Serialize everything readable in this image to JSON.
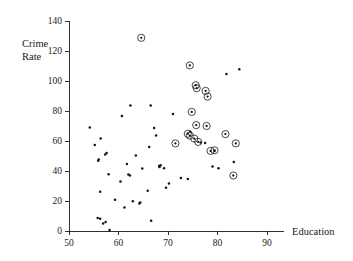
{
  "chart_data": {
    "type": "scatter",
    "title": "",
    "xlabel": "Education",
    "ylabel": "Crime Rate",
    "xlim": [
      50,
      90
    ],
    "ylim": [
      0,
      140
    ],
    "xticks": [
      50,
      60,
      70,
      80,
      90
    ],
    "yticks": [
      0,
      20,
      40,
      60,
      80,
      100,
      120,
      140
    ],
    "grid": false,
    "legend": null,
    "marker_note": "plain dot = ordinary observation; dot enclosed in open circle = highlighted/flagged observation",
    "series": [
      {
        "name": "observations",
        "marker": "dot",
        "points": [
          [
            54.2,
            69.0
          ],
          [
            55.2,
            57.4
          ],
          [
            55.9,
            46.8
          ],
          [
            56.0,
            47.6
          ],
          [
            56.4,
            61.6
          ],
          [
            56.3,
            26.2
          ],
          [
            55.8,
            8.6
          ],
          [
            56.3,
            8.2
          ],
          [
            56.9,
            5.0
          ],
          [
            57.4,
            6.0
          ],
          [
            57.3,
            51.0
          ],
          [
            57.6,
            52.0
          ],
          [
            58.0,
            37.8
          ],
          [
            58.2,
            0.6
          ],
          [
            59.3,
            20.8
          ],
          [
            60.4,
            33.0
          ],
          [
            60.7,
            76.6
          ],
          [
            61.2,
            15.6
          ],
          [
            61.7,
            44.6
          ],
          [
            62.0,
            37.6
          ],
          [
            62.3,
            37.0
          ],
          [
            62.4,
            83.6
          ],
          [
            62.9,
            19.8
          ],
          [
            63.5,
            50.4
          ],
          [
            64.2,
            18.4
          ],
          [
            64.4,
            19.0
          ],
          [
            64.8,
            41.6
          ],
          [
            65.9,
            26.8
          ],
          [
            66.2,
            56.0
          ],
          [
            66.5,
            83.6
          ],
          [
            66.6,
            6.8
          ],
          [
            67.2,
            68.6
          ],
          [
            67.6,
            63.6
          ],
          [
            68.2,
            43.4
          ],
          [
            68.3,
            42.6
          ],
          [
            68.5,
            43.8
          ],
          [
            69.2,
            41.8
          ],
          [
            69.6,
            28.8
          ],
          [
            70.2,
            31.6
          ],
          [
            71.0,
            78.0
          ],
          [
            72.6,
            35.4
          ],
          [
            74.0,
            34.6
          ],
          [
            74.5,
            66.2
          ],
          [
            76.6,
            59.0
          ],
          [
            77.5,
            58.6
          ],
          [
            79.0,
            43.0
          ],
          [
            79.4,
            53.4
          ],
          [
            80.2,
            41.8
          ],
          [
            81.8,
            104.6
          ],
          [
            83.3,
            46.0
          ],
          [
            84.4,
            107.8
          ]
        ]
      },
      {
        "name": "highlighted observations",
        "marker": "circled-dot",
        "points": [
          [
            64.6,
            128.8
          ],
          [
            74.4,
            110.4
          ],
          [
            75.6,
            97.2
          ],
          [
            75.8,
            95.2
          ],
          [
            77.6,
            93.4
          ],
          [
            78.0,
            89.6
          ],
          [
            74.8,
            79.4
          ],
          [
            75.7,
            70.6
          ],
          [
            77.8,
            70.0
          ],
          [
            74.0,
            64.8
          ],
          [
            74.4,
            63.6
          ],
          [
            75.3,
            61.6
          ],
          [
            76.1,
            59.4
          ],
          [
            71.5,
            58.4
          ],
          [
            78.6,
            53.4
          ],
          [
            79.4,
            53.8
          ],
          [
            81.6,
            64.6
          ],
          [
            83.7,
            58.4
          ],
          [
            83.2,
            37.0
          ]
        ]
      }
    ]
  }
}
